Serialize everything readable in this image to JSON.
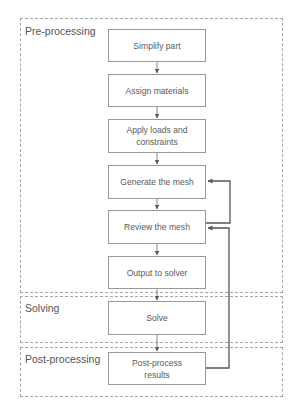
{
  "diagram": {
    "type": "flowchart",
    "stages": [
      {
        "id": "pre",
        "label": "Pre-processing"
      },
      {
        "id": "solve",
        "label": "Solving"
      },
      {
        "id": "post",
        "label": "Post-processing"
      }
    ],
    "steps": [
      {
        "id": "simplify",
        "stage": "pre",
        "label": "Simplify part"
      },
      {
        "id": "materials",
        "stage": "pre",
        "label": "Assign materials"
      },
      {
        "id": "loads",
        "stage": "pre",
        "label": "Apply loads and constraints"
      },
      {
        "id": "generate",
        "stage": "pre",
        "label": "Generate the mesh"
      },
      {
        "id": "review",
        "stage": "pre",
        "label": "Review the mesh"
      },
      {
        "id": "output",
        "stage": "pre",
        "label": "Output to solver"
      },
      {
        "id": "solve",
        "stage": "solve",
        "label": "Solve"
      },
      {
        "id": "postprocess",
        "stage": "post",
        "label": "Post-process results"
      }
    ],
    "edges": [
      {
        "from": "simplify",
        "to": "materials"
      },
      {
        "from": "materials",
        "to": "loads"
      },
      {
        "from": "loads",
        "to": "generate"
      },
      {
        "from": "generate",
        "to": "review"
      },
      {
        "from": "review",
        "to": "output"
      },
      {
        "from": "output",
        "to": "solve"
      },
      {
        "from": "solve",
        "to": "postprocess"
      },
      {
        "from": "review",
        "to": "generate",
        "kind": "feedback"
      },
      {
        "from": "postprocess",
        "to": "review",
        "kind": "feedback"
      }
    ],
    "colors": {
      "box_border": "#9a9a9a",
      "frame_border": "#a6a6a6",
      "arrow": "#5a5a5a",
      "feedback_arrow": "#555555",
      "text": "#555555"
    }
  }
}
